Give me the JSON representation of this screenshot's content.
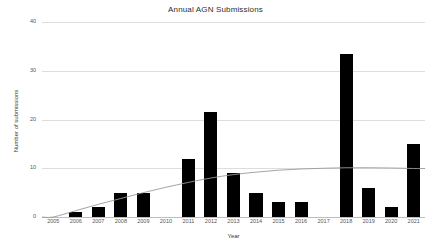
{
  "chart_data": {
    "type": "bar",
    "title": "Annual AGN Submissions",
    "xlabel": "Year",
    "ylabel": "Number of submissions",
    "categories": [
      "2005",
      "2006",
      "2007",
      "2008",
      "2009",
      "2010",
      "2011",
      "2012",
      "2013",
      "2014",
      "2015",
      "2016",
      "2017",
      "2018",
      "2019",
      "2020",
      "2021"
    ],
    "values": [
      0,
      1,
      2,
      5,
      5,
      0,
      12,
      21.5,
      9,
      5,
      3,
      3,
      0,
      33.5,
      6,
      2,
      15
    ],
    "series": [
      {
        "name": "Number of submissions",
        "type": "bar",
        "color": "#000000",
        "values": [
          0,
          1,
          2,
          5,
          5,
          0,
          12,
          21.5,
          9,
          5,
          3,
          3,
          0,
          33.5,
          6,
          2,
          15
        ]
      },
      {
        "name": "trend",
        "type": "line",
        "color": "#9a9a9a",
        "values": [
          0.0,
          1.3,
          2.6,
          3.8,
          5.0,
          6.1,
          7.1,
          8.0,
          8.7,
          9.2,
          9.6,
          9.85,
          10.0,
          10.1,
          10.1,
          10.05,
          9.95
        ]
      }
    ],
    "ylim": [
      0,
      40
    ],
    "yticks": [
      0,
      10,
      20,
      30,
      40
    ],
    "ytick_labels": [
      "0",
      "10",
      "20",
      "30",
      "40"
    ],
    "grid": true,
    "grid_axis": "y",
    "legend": "none",
    "background": "#ffffff"
  },
  "colors": {
    "bar": "#000000",
    "trend": "#9a9a9a",
    "grid": "#dddddd",
    "axis": "#bdbdbd",
    "text": "#3a3a3a",
    "tick_text": "#555555",
    "background": "#ffffff"
  }
}
